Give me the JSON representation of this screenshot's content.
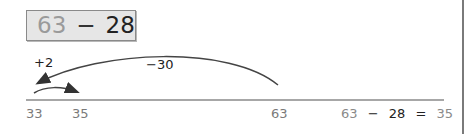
{
  "problem": {
    "minuend": "63",
    "operator": "−",
    "subtrahend": "28"
  },
  "number_line": {
    "ticks": [
      {
        "label": "33",
        "x": 26
      },
      {
        "label": "35",
        "x": 72
      },
      {
        "label": "63",
        "x": 271
      }
    ],
    "jumps": [
      {
        "label": "−30",
        "from": "63",
        "to": "33"
      },
      {
        "label": "+2",
        "from": "33",
        "to": "35"
      }
    ]
  },
  "equation": {
    "a": "63",
    "op": "−",
    "b": "28",
    "eq": "=",
    "result": "35"
  },
  "colors": {
    "box_bg": "#e6e6e6",
    "line": "#8a8a8a",
    "arrow": "#333333",
    "gray_text": "#8a8a8a"
  }
}
